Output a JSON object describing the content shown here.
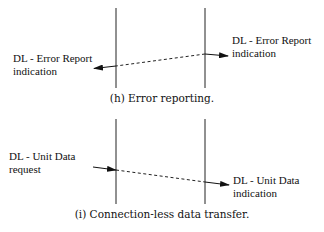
{
  "panels": [
    {
      "id": "h",
      "caption": "(h) Error reporting.",
      "left_label": {
        "line1": "DL - Error Report",
        "line2": "indication"
      },
      "right_label": {
        "line1": "DL - Error Report",
        "line2": "indication"
      }
    },
    {
      "id": "i",
      "caption": "(i) Connection-less data transfer.",
      "left_label": {
        "line1": "DL -  Unit  Data",
        "line2": "request"
      },
      "right_label": {
        "line1": "DL -  Unit  Data",
        "line2": "indication"
      }
    }
  ]
}
